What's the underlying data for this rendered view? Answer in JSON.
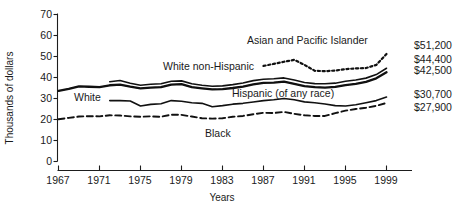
{
  "chart_data": {
    "type": "line",
    "title": "",
    "xlabel": "Years",
    "ylabel": "Thousands of dollars",
    "xlim": [
      1967,
      2000
    ],
    "ylim": [
      0,
      70
    ],
    "xticks": [
      1967,
      1971,
      1975,
      1979,
      1983,
      1987,
      1991,
      1995,
      1999
    ],
    "yticks": [
      0,
      10,
      20,
      30,
      40,
      50,
      60,
      70
    ],
    "grid": false,
    "legend_position": "inline-annotations",
    "series": [
      {
        "name": "Asian and Pacific Islander",
        "style": "dotted",
        "end_label": "$51,200",
        "x": [
          1987,
          1988,
          1989,
          1990,
          1991,
          1992,
          1993,
          1994,
          1995,
          1996,
          1997,
          1998,
          1999
        ],
        "values": [
          45.5,
          46.5,
          47.5,
          48.4,
          46.0,
          43.2,
          43.0,
          43.3,
          44.0,
          44.3,
          44.5,
          46.0,
          51.2
        ]
      },
      {
        "name": "White non-Hispanic",
        "style": "solid",
        "end_label": "$44,400",
        "x": [
          1972,
          1973,
          1974,
          1975,
          1976,
          1977,
          1978,
          1979,
          1980,
          1981,
          1982,
          1983,
          1984,
          1985,
          1986,
          1987,
          1988,
          1989,
          1990,
          1991,
          1992,
          1993,
          1994,
          1995,
          1996,
          1997,
          1998,
          1999
        ],
        "values": [
          38.0,
          38.6,
          37.3,
          36.3,
          36.8,
          37.0,
          38.2,
          38.4,
          37.0,
          36.3,
          35.8,
          36.0,
          36.6,
          37.4,
          38.5,
          39.2,
          39.4,
          39.8,
          38.8,
          37.6,
          37.1,
          37.0,
          37.3,
          38.2,
          38.8,
          39.7,
          41.4,
          44.4
        ]
      },
      {
        "name": "White",
        "style": "thick-dashed",
        "end_label": "$42,500",
        "x": [
          1967,
          1968,
          1969,
          1970,
          1971,
          1972,
          1973,
          1974,
          1975,
          1976,
          1977,
          1978,
          1979,
          1980,
          1981,
          1982,
          1983,
          1984,
          1985,
          1986,
          1987,
          1988,
          1989,
          1990,
          1991,
          1992,
          1993,
          1994,
          1995,
          1996,
          1997,
          1998,
          1999
        ],
        "values": [
          33.6,
          34.6,
          35.8,
          35.6,
          35.4,
          36.3,
          36.6,
          35.6,
          34.8,
          35.2,
          35.4,
          36.6,
          36.8,
          35.4,
          34.8,
          34.3,
          34.5,
          35.0,
          35.7,
          36.7,
          37.4,
          37.6,
          38.0,
          37.0,
          35.9,
          35.4,
          35.2,
          35.5,
          36.4,
          37.0,
          37.9,
          39.6,
          42.5
        ]
      },
      {
        "name": "Hispanic (of any race)",
        "style": "solid",
        "end_label": "$30,700",
        "x": [
          1972,
          1973,
          1974,
          1975,
          1976,
          1977,
          1978,
          1979,
          1980,
          1981,
          1982,
          1983,
          1984,
          1985,
          1986,
          1987,
          1988,
          1989,
          1990,
          1991,
          1992,
          1993,
          1994,
          1995,
          1996,
          1997,
          1998,
          1999
        ],
        "values": [
          29.0,
          29.0,
          28.8,
          26.4,
          27.2,
          27.5,
          29.0,
          28.7,
          28.0,
          27.7,
          26.1,
          26.6,
          27.3,
          27.7,
          28.3,
          29.0,
          29.4,
          30.0,
          29.4,
          28.4,
          28.0,
          27.4,
          26.6,
          26.4,
          27.0,
          28.0,
          29.0,
          30.7
        ]
      },
      {
        "name": "Black",
        "style": "dashed",
        "end_label": "$27,900",
        "x": [
          1967,
          1968,
          1969,
          1970,
          1971,
          1972,
          1973,
          1974,
          1975,
          1976,
          1977,
          1978,
          1979,
          1980,
          1981,
          1982,
          1983,
          1984,
          1985,
          1986,
          1987,
          1988,
          1989,
          1990,
          1991,
          1992,
          1993,
          1994,
          1995,
          1996,
          1997,
          1998,
          1999
        ],
        "values": [
          20.1,
          20.8,
          21.4,
          21.6,
          21.5,
          22.0,
          21.9,
          21.5,
          21.3,
          21.5,
          21.3,
          22.3,
          22.2,
          21.4,
          20.6,
          20.4,
          20.6,
          21.3,
          21.7,
          22.5,
          23.2,
          23.1,
          23.6,
          22.7,
          22.0,
          21.7,
          21.7,
          23.0,
          24.2,
          25.0,
          25.6,
          26.5,
          27.9
        ]
      }
    ]
  },
  "axes": {
    "y_title": "Thousands of dollars",
    "x_title": "Years",
    "y_tick_labels": [
      "0",
      "10",
      "20",
      "30",
      "40",
      "50",
      "60",
      "70"
    ],
    "x_tick_labels": [
      "1967",
      "1971",
      "1975",
      "1979",
      "1983",
      "1987",
      "1991",
      "1995",
      "1999"
    ]
  },
  "annotations": {
    "asian_pacific": "Asian and Pacific Islander",
    "white_non_hispanic": "White non-Hispanic",
    "white": "White",
    "hispanic": "Hispanic (of any race)",
    "black": "Black"
  },
  "end_labels": {
    "asian_pacific": "$51,200",
    "white_non_hispanic": "$44,400",
    "white": "$42,500",
    "hispanic": "$30,700",
    "black": "$27,900"
  },
  "colors": {
    "ink": "#111111",
    "background": "#ffffff"
  }
}
